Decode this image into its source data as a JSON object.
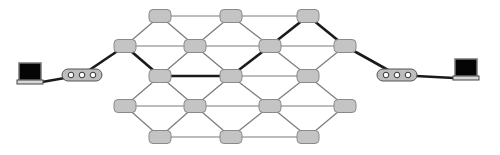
{
  "diagram": {
    "title": "",
    "colors": {
      "background": "#ffffff",
      "node_fill": "#c4c4c4",
      "edge_thin": "#7a7a7a",
      "edge_thick": "#1a1a1a"
    },
    "node_size": {
      "w": 22,
      "h": 13
    },
    "nodes": [
      {
        "id": "r1c1",
        "x": 160,
        "y": 16
      },
      {
        "id": "r1c2",
        "x": 231,
        "y": 16
      },
      {
        "id": "r1c3",
        "x": 308,
        "y": 16
      },
      {
        "id": "r2c1",
        "x": 125,
        "y": 46
      },
      {
        "id": "r2c2",
        "x": 195,
        "y": 46
      },
      {
        "id": "r2c3",
        "x": 270,
        "y": 46
      },
      {
        "id": "r2c4",
        "x": 345,
        "y": 46
      },
      {
        "id": "r3c1",
        "x": 160,
        "y": 76
      },
      {
        "id": "r3c2",
        "x": 231,
        "y": 76
      },
      {
        "id": "r3c3",
        "x": 308,
        "y": 76
      },
      {
        "id": "r4c1",
        "x": 125,
        "y": 106
      },
      {
        "id": "r4c2",
        "x": 195,
        "y": 106
      },
      {
        "id": "r4c3",
        "x": 270,
        "y": 106
      },
      {
        "id": "r4c4",
        "x": 345,
        "y": 106
      },
      {
        "id": "r5c1",
        "x": 160,
        "y": 137
      },
      {
        "id": "r5c2",
        "x": 231,
        "y": 137
      },
      {
        "id": "r5c3",
        "x": 308,
        "y": 137
      }
    ],
    "hubs": [
      {
        "id": "hub-left",
        "x": 82,
        "y": 75,
        "ports": 3
      },
      {
        "id": "hub-right",
        "x": 397,
        "y": 75,
        "ports": 3
      }
    ],
    "computers": [
      {
        "id": "pc-left",
        "x": 30,
        "y": 74
      },
      {
        "id": "pc-right",
        "x": 466,
        "y": 70
      }
    ],
    "edges": [
      {
        "from": "r1c1",
        "to": "r1c2",
        "thick": false
      },
      {
        "from": "r1c2",
        "to": "r1c3",
        "thick": false
      },
      {
        "from": "r1c1",
        "to": "r2c1",
        "thick": false
      },
      {
        "from": "r1c1",
        "to": "r2c2",
        "thick": false
      },
      {
        "from": "r1c2",
        "to": "r2c2",
        "thick": false
      },
      {
        "from": "r1c2",
        "to": "r2c3",
        "thick": false
      },
      {
        "from": "r1c3",
        "to": "r2c3",
        "thick": true
      },
      {
        "from": "r1c3",
        "to": "r2c4",
        "thick": true
      },
      {
        "from": "r2c1",
        "to": "r2c2",
        "thick": false
      },
      {
        "from": "r2c2",
        "to": "r2c3",
        "thick": false
      },
      {
        "from": "r2c3",
        "to": "r2c4",
        "thick": false
      },
      {
        "from": "r2c1",
        "to": "r3c1",
        "thick": true
      },
      {
        "from": "r2c2",
        "to": "r3c1",
        "thick": false
      },
      {
        "from": "r2c2",
        "to": "r3c2",
        "thick": false
      },
      {
        "from": "r2c3",
        "to": "r3c2",
        "thick": true
      },
      {
        "from": "r2c3",
        "to": "r3c3",
        "thick": false
      },
      {
        "from": "r2c4",
        "to": "r3c3",
        "thick": false
      },
      {
        "from": "r3c1",
        "to": "r3c2",
        "thick": true
      },
      {
        "from": "r3c2",
        "to": "r3c3",
        "thick": false
      },
      {
        "from": "r3c1",
        "to": "r4c1",
        "thick": false
      },
      {
        "from": "r3c1",
        "to": "r4c2",
        "thick": false
      },
      {
        "from": "r3c2",
        "to": "r4c2",
        "thick": false
      },
      {
        "from": "r3c2",
        "to": "r4c3",
        "thick": false
      },
      {
        "from": "r3c3",
        "to": "r4c3",
        "thick": false
      },
      {
        "from": "r3c3",
        "to": "r4c4",
        "thick": false
      },
      {
        "from": "r4c1",
        "to": "r4c2",
        "thick": false
      },
      {
        "from": "r4c2",
        "to": "r4c3",
        "thick": false
      },
      {
        "from": "r4c3",
        "to": "r4c4",
        "thick": false
      },
      {
        "from": "r4c1",
        "to": "r5c1",
        "thick": false
      },
      {
        "from": "r4c2",
        "to": "r5c1",
        "thick": false
      },
      {
        "from": "r4c2",
        "to": "r5c2",
        "thick": false
      },
      {
        "from": "r4c3",
        "to": "r5c2",
        "thick": false
      },
      {
        "from": "r4c3",
        "to": "r5c3",
        "thick": false
      },
      {
        "from": "r4c4",
        "to": "r5c3",
        "thick": false
      },
      {
        "from": "r5c1",
        "to": "r5c2",
        "thick": false
      },
      {
        "from": "r5c2",
        "to": "r5c3",
        "thick": false
      },
      {
        "from": "pc-left",
        "to": "hub-left",
        "thick": true
      },
      {
        "from": "hub-left",
        "to": "r2c1",
        "thick": true
      },
      {
        "from": "r2c4",
        "to": "hub-right",
        "thick": true
      },
      {
        "from": "hub-right",
        "to": "pc-right",
        "thick": true
      }
    ]
  }
}
